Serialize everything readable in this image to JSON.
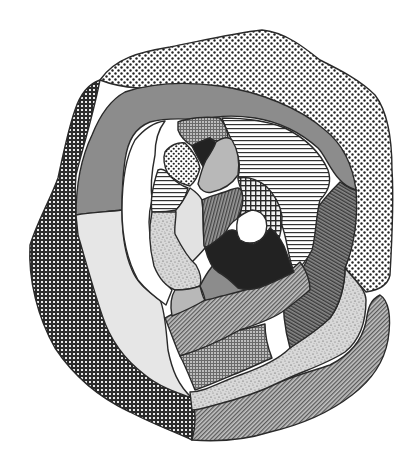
{
  "figure": {
    "type": "patterned region diagram"
  },
  "colors": {
    "background": "#ffffff",
    "outline": "#2a2a2a",
    "solid_dark": "#222222",
    "medium_gray": "#8a8a8a",
    "light_gray": "#b5b5b5",
    "very_light_gray": "#e6e6e6",
    "white": "#ffffff"
  },
  "regions": [
    {
      "id": "outer-top-dotted",
      "texture": "sparse-dots",
      "ring": 1
    },
    {
      "id": "outer-left-checker",
      "texture": "dark-checker",
      "ring": 1
    },
    {
      "id": "outer-bottom-hatch",
      "texture": "diagonal-hatch",
      "ring": 1
    },
    {
      "id": "gray-arc",
      "texture": "solid-medium-gray",
      "ring": 2
    },
    {
      "id": "light-left-band",
      "texture": "solid-very-light-gray",
      "ring": 2
    },
    {
      "id": "stipple-band",
      "texture": "stipple-noise",
      "ring": 2
    },
    {
      "id": "dark-diagonal-band",
      "texture": "dark-diagonal-lines",
      "ring": 2
    },
    {
      "id": "white-crescent",
      "texture": "solid-white",
      "ring": 3
    },
    {
      "id": "horizontal-stripe-arc",
      "texture": "horizontal-lines",
      "ring": 3
    },
    {
      "id": "lower-hatch-band",
      "texture": "diagonal-hatch",
      "ring": 3
    },
    {
      "id": "fine-grid-patch",
      "texture": "fine-grid",
      "ring": 3
    },
    {
      "id": "top-fine-grid",
      "texture": "fine-grid",
      "ring": 4
    },
    {
      "id": "small-dotted",
      "texture": "dense-dots",
      "ring": 4
    },
    {
      "id": "small-black-top",
      "texture": "solid-dark",
      "ring": 4
    },
    {
      "id": "light-gray-top",
      "texture": "solid-light-gray",
      "ring": 4
    },
    {
      "id": "small-horizontal",
      "texture": "horizontal-lines",
      "ring": 4
    },
    {
      "id": "pale-left",
      "texture": "solid-very-light-gray",
      "ring": 4
    },
    {
      "id": "stipple-left",
      "texture": "stipple-noise",
      "ring": 4
    },
    {
      "id": "light-gray-bottom",
      "texture": "solid-light-gray",
      "ring": 4
    },
    {
      "id": "medium-gray-bottom",
      "texture": "solid-medium-gray",
      "ring": 4
    },
    {
      "id": "vertical-stripe",
      "texture": "vertical-lines",
      "ring": 4
    },
    {
      "id": "checker-center",
      "texture": "open-checker",
      "ring": 5
    },
    {
      "id": "black-core",
      "texture": "solid-dark",
      "ring": 5
    },
    {
      "id": "white-hole",
      "texture": "solid-white",
      "ring": 6
    }
  ]
}
